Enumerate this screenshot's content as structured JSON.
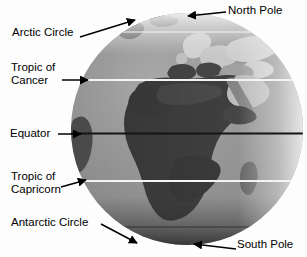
{
  "figure": {
    "background_color": "#fdfdfd",
    "ocean_color": "#8c8c8c",
    "land_color": "#3d3d3d",
    "desert_color": "#c9c9c9",
    "polar_highlight_color": "#e8e8e8",
    "latitude_line_color": "#f2f2f2",
    "equator_line_color": "#141414",
    "annotation_color": "#000000"
  },
  "annotations": [
    {
      "id": "north-pole",
      "label": "North Pole",
      "arrow": "left",
      "target": "top of globe"
    },
    {
      "id": "arctic-circle",
      "label": "Arctic Circle",
      "arrow": "up-right",
      "target": "upper-left limb of globe"
    },
    {
      "id": "tropic-of-cancer",
      "label_line1": "Tropic of",
      "label_line2": "Cancer",
      "label": "Tropic of Cancer",
      "arrow": "right",
      "target": "northern white latitude line"
    },
    {
      "id": "equator",
      "label": "Equator",
      "arrow": "right",
      "target": "central dark latitude line"
    },
    {
      "id": "tropic-of-capricorn",
      "label_line1": "Tropic of",
      "label_line2": "Capricorn",
      "label": "Tropic of Capricorn",
      "arrow": "up-right",
      "target": "southern white latitude line"
    },
    {
      "id": "antarctic-circle",
      "label": "Antarctic Circle",
      "arrow": "down-right",
      "target": "lower-left limb of globe"
    },
    {
      "id": "south-pole",
      "label": "South Pole",
      "arrow": "left",
      "target": "bottom of globe"
    }
  ],
  "labels": {
    "north_pole": "North Pole",
    "arctic_circle": "Arctic Circle",
    "tropic_of_cancer_line1": "Tropic of",
    "tropic_of_cancer_line2": "Cancer",
    "equator": "Equator",
    "tropic_of_capricorn_line1": "Tropic of",
    "tropic_of_capricorn_line2": "Capricorn",
    "antarctic_circle": "Antarctic Circle",
    "south_pole": "South Pole"
  }
}
